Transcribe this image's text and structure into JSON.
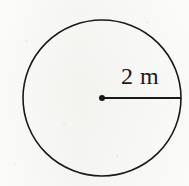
{
  "figure": {
    "kind": "circle-radius-diagram",
    "background_color": "#f5f5f3",
    "ink_color": "#191919",
    "circle": {
      "center_x": 102,
      "center_y": 98,
      "radius_x": 79,
      "radius_y": 78,
      "stroke_width": 1.6,
      "fill": "none"
    },
    "center_point": {
      "x": 102,
      "y": 98,
      "diameter": 6
    },
    "radius_segment": {
      "from_x": 102,
      "from_y": 98,
      "to_x": 181,
      "to_y": 98,
      "stroke_width": 1.8
    },
    "labels": {
      "radius": {
        "text": "2 m",
        "value": 2,
        "unit": "m",
        "x": 121,
        "y": 64
      }
    }
  }
}
